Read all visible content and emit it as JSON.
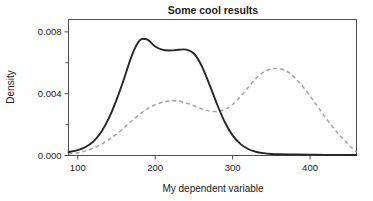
{
  "chart_data": {
    "type": "line",
    "title": "Some cool results",
    "xlabel": "My dependent variable",
    "ylabel": "Density",
    "xlim": [
      88,
      460
    ],
    "ylim": [
      0,
      0.0088
    ],
    "grid": false,
    "legend": "none",
    "x_ticks": [
      100,
      200,
      300,
      400
    ],
    "x_tick_labels": [
      "100",
      "200",
      "300",
      "400"
    ],
    "y_ticks": [
      0.0,
      0.004,
      0.008
    ],
    "y_tick_labels": [
      "0.000",
      "0.004",
      "0.008"
    ],
    "y_minor_ticks": [
      0.002,
      0.006
    ],
    "series": [
      {
        "name": "solid-density",
        "style": "solid",
        "color": "#262626",
        "x": [
          88,
          100,
          110,
          120,
          130,
          140,
          150,
          160,
          170,
          180,
          190,
          200,
          210,
          220,
          230,
          240,
          250,
          260,
          270,
          280,
          290,
          300,
          310,
          320,
          330,
          340,
          350,
          360,
          380,
          400,
          420,
          440,
          460
        ],
        "y": [
          0.00022,
          0.00035,
          0.00055,
          0.0009,
          0.0015,
          0.0024,
          0.0036,
          0.005,
          0.0065,
          0.00745,
          0.0075,
          0.00705,
          0.00683,
          0.0068,
          0.00684,
          0.00685,
          0.0066,
          0.0058,
          0.0046,
          0.0033,
          0.00215,
          0.0013,
          0.00075,
          0.00042,
          0.00024,
          0.00015,
          0.0001,
          8e-05,
          6e-05,
          5e-05,
          4e-05,
          4e-05,
          3e-05
        ]
      },
      {
        "name": "dashed-density",
        "style": "dashed",
        "color": "#a3a3a3",
        "x": [
          88,
          100,
          110,
          120,
          130,
          140,
          150,
          160,
          170,
          180,
          190,
          200,
          210,
          220,
          230,
          240,
          250,
          260,
          270,
          280,
          290,
          300,
          310,
          320,
          330,
          340,
          350,
          360,
          370,
          380,
          390,
          400,
          410,
          420,
          430,
          440,
          450,
          460
        ],
        "y": [
          0.0001,
          0.00018,
          0.0003,
          0.00048,
          0.00072,
          0.00102,
          0.00138,
          0.0018,
          0.00225,
          0.00268,
          0.00302,
          0.00328,
          0.00345,
          0.00353,
          0.00352,
          0.0034,
          0.00322,
          0.00302,
          0.00288,
          0.00285,
          0.00298,
          0.0033,
          0.0038,
          0.0044,
          0.00498,
          0.0054,
          0.0056,
          0.00562,
          0.00545,
          0.00505,
          0.0045,
          0.00385,
          0.00315,
          0.00245,
          0.0018,
          0.00122,
          0.0007,
          0.0002
        ]
      }
    ]
  }
}
